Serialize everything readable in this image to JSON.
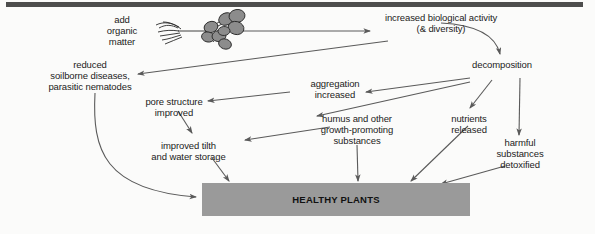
{
  "figure": {
    "background_color": "#fbfbfa",
    "rule_color": "#4d4d4d",
    "arrow_color": "#5a5a5a",
    "box_fill": "#9a9a9a",
    "nodule_fill": "#8c8c8c",
    "text_color": "#1b1b1b"
  },
  "nodes": {
    "add_organic_matter": "add\norganic\nmatter",
    "increased_biological_activity": "increased biological activity\n(& diversity)",
    "decomposition": "decomposition",
    "reduced_soilborne": "reduced\nsoilborne  diseases,\nparasitic nematodes",
    "aggregation_increased": "aggregation\nincreased",
    "pore_structure_improved": "pore structure\nimproved",
    "nutrients_released": "nutrients\nreleased",
    "humus_growth_promoting": "humus and other\ngrowth-promoting\nsubstances",
    "improved_tilth": "improved tilth\nand water storage",
    "harmful_substances_detoxified": "harmful\nsubstances\ndetoxified",
    "healthy_plants": "HEALTHY PLANTS"
  },
  "illustration": {
    "name": "legume-root-with-nodules",
    "description": "root system with rhizobium nodules"
  },
  "edges": [
    {
      "from": "add_organic_matter",
      "to": "increased_biological_activity"
    },
    {
      "from": "add_organic_matter",
      "to": "reduced_soilborne"
    },
    {
      "from": "increased_biological_activity",
      "to": "decomposition"
    },
    {
      "from": "decomposition",
      "to": "aggregation_increased"
    },
    {
      "from": "decomposition",
      "to": "nutrients_released"
    },
    {
      "from": "decomposition",
      "to": "humus_growth_promoting"
    },
    {
      "from": "decomposition",
      "to": "harmful_substances_detoxified"
    },
    {
      "from": "aggregation_increased",
      "to": "pore_structure_improved"
    },
    {
      "from": "pore_structure_improved",
      "to": "improved_tilth"
    },
    {
      "from": "humus_growth_promoting",
      "to": "improved_tilth"
    },
    {
      "from": "humus_growth_promoting",
      "to": "healthy_plants"
    },
    {
      "from": "improved_tilth",
      "to": "healthy_plants"
    },
    {
      "from": "nutrients_released",
      "to": "healthy_plants"
    },
    {
      "from": "harmful_substances_detoxified",
      "to": "healthy_plants"
    },
    {
      "from": "reduced_soilborne",
      "to": "healthy_plants"
    }
  ]
}
